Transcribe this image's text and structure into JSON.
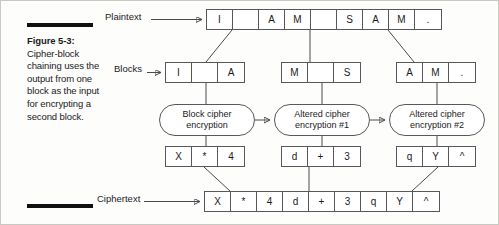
{
  "figure": {
    "caption_title": "Figure 5-3:",
    "caption_body": "Cipher-block chaining uses the output from one block as the input for encrypting a second block."
  },
  "labels": {
    "plaintext": "Plaintext",
    "blocks": "Blocks",
    "ciphertext": "Ciphertext"
  },
  "plaintext_cells": [
    "I",
    "",
    "A",
    "M",
    "",
    "S",
    "A",
    "M",
    "."
  ],
  "ciphertext_cells": [
    "X",
    "*",
    "4",
    "d",
    "+",
    "3",
    "q",
    "Y",
    "^"
  ],
  "blocks": [
    {
      "cells": [
        "I",
        "",
        "A"
      ]
    },
    {
      "cells": [
        "M",
        "",
        "S"
      ]
    },
    {
      "cells": [
        "A",
        "M",
        "."
      ]
    }
  ],
  "cipher_blocks": [
    {
      "cells": [
        "X",
        "*",
        "4"
      ]
    },
    {
      "cells": [
        "d",
        "+",
        "3"
      ]
    },
    {
      "cells": [
        "q",
        "Y",
        "^"
      ]
    }
  ],
  "processes": [
    {
      "line1": "Block cipher",
      "line2": "encryption"
    },
    {
      "line1": "Altered cipher",
      "line2": "encryption #1"
    },
    {
      "line1": "Altered cipher",
      "line2": "encryption #2"
    }
  ],
  "colors": {
    "ink": "#1a1a1c",
    "stroke": "#58585c",
    "wire": "#4a4a4e",
    "rule": "#111113",
    "paper": "#fdfdfc"
  }
}
